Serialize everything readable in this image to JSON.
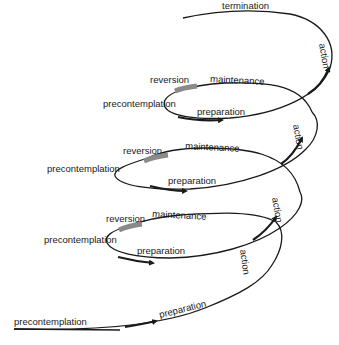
{
  "diagram": {
    "type": "spiral model of stages of change",
    "stages": [
      "precontemplation",
      "preparation",
      "action",
      "maintenance",
      "reversion",
      "termination"
    ],
    "entry": {
      "precontemplation": "precontemplation",
      "preparation": "preparation",
      "action": "action"
    },
    "loops": [
      {
        "reversion": "reversion",
        "maintenance": "maintenance",
        "precontemplation": "precontemplation",
        "preparation": "preparation",
        "action": "action"
      },
      {
        "reversion": "reversion",
        "maintenance": "maintenance",
        "precontemplation": "precontemplation",
        "preparation": "preparation",
        "action": "action"
      },
      {
        "reversion": "reversion",
        "maintenance": "maintenance",
        "precontemplation": "precontemplation",
        "preparation": "preparation",
        "action": "action"
      }
    ],
    "exit": {
      "termination": "termination"
    },
    "colors": {
      "line": "#1a1a1a",
      "reversion_bar": "#8a8a8a",
      "background": "#ffffff"
    }
  }
}
